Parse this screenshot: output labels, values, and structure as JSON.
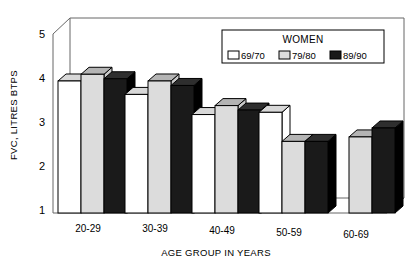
{
  "chart_data": {
    "type": "bar",
    "title": "",
    "xlabel": "AGE GROUP IN YEARS",
    "ylabel": "FVC, LITRES BTPS",
    "categories": [
      "20-29",
      "30-39",
      "40-49",
      "50-59",
      "60-69"
    ],
    "yticks": [
      "1",
      "2",
      "3",
      "4",
      "5"
    ],
    "ylim": [
      1,
      5
    ],
    "grid": false,
    "legend_position": "top-right",
    "legend_title": "WOMEN",
    "style": "3d-bar",
    "series": [
      {
        "name": "69/70",
        "color": "#ffffff",
        "values": [
          3.95,
          3.65,
          3.2,
          3.25,
          null
        ]
      },
      {
        "name": "79/80",
        "color": "#dcdcdc",
        "values": [
          4.1,
          3.95,
          3.4,
          2.6,
          2.7
        ]
      },
      {
        "name": "89/90",
        "color": "#1a1a1a",
        "values": [
          4.0,
          3.85,
          3.3,
          2.6,
          2.9
        ]
      }
    ]
  },
  "colors": {
    "axis": "#555555",
    "bar_outline": "#000000",
    "series_69_70": "#ffffff",
    "series_79_80": "#dcdcdc",
    "series_89_90": "#1a1a1a",
    "background": "#ffffff"
  },
  "labels": {
    "y_axis_title": "FVC, LITRES BTPS",
    "x_axis_title": "AGE GROUP IN YEARS",
    "legend_title": "WOMEN",
    "legend_items": [
      "69/70",
      "79/80",
      "89/90"
    ],
    "y_ticks": [
      "5",
      "4",
      "3",
      "2",
      "1"
    ],
    "x_categories": [
      "20-29",
      "30-39",
      "40-49",
      "50-59",
      "60-69"
    ]
  }
}
